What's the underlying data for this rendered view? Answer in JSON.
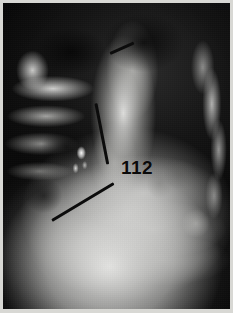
{
  "figure": {
    "caption_number": "112",
    "modality_label": "radiograph",
    "image_kind": "grayscale-x-ray"
  },
  "plate": {
    "width_px": 233,
    "height_px": 313,
    "border_color": "#d8d8d4",
    "film_background_color": "#0b0b0b"
  },
  "annotations": [
    {
      "name": "pointer-line-upper",
      "label": "",
      "color": "#0c0c0c",
      "x1_px": 110,
      "y1_px": 52,
      "x2_px": 133,
      "y2_px": 42,
      "length_px": 26,
      "angle_deg": -24
    },
    {
      "name": "pointer-line-middle",
      "label": "",
      "color": "#0c0c0c",
      "x1_px": 96,
      "y1_px": 102,
      "x2_px": 108,
      "y2_px": 162,
      "length_px": 62,
      "angle_deg": 79
    },
    {
      "name": "pointer-line-lower",
      "label": "",
      "color": "#0c0c0c",
      "x1_px": 52,
      "y1_px": 219,
      "x2_px": 114,
      "y2_px": 182,
      "length_px": 72,
      "angle_deg": -31
    }
  ],
  "radiographic_features": [
    {
      "name": "dark-air-field-upper",
      "description": "radiolucent dark field across upper thorax"
    },
    {
      "name": "bright-rib-edges-left",
      "description": "cortical rib margins, left thoracic wall"
    },
    {
      "name": "bright-rib-edges-right",
      "description": "cortical rib margins, right thoracic wall"
    },
    {
      "name": "vertebral-mediastinal-column",
      "description": "bright central column of increased density"
    },
    {
      "name": "soft-tissue-mass-lower",
      "description": "large bright soft-tissue opacity in lower field"
    },
    {
      "name": "focal-bright-opacity",
      "description": "small high-density focus, mid-left field"
    },
    {
      "name": "diaphragm-arc",
      "description": "curved bright interface lines across mid-lower field"
    }
  ],
  "colors": {
    "annotation_ink": "#0c0c0c",
    "caption_ink": "#0a0a0a",
    "film_black": "#0b0b0b",
    "tissue_white": "#e8e8e6",
    "mount_border": "#d8d8d4"
  }
}
